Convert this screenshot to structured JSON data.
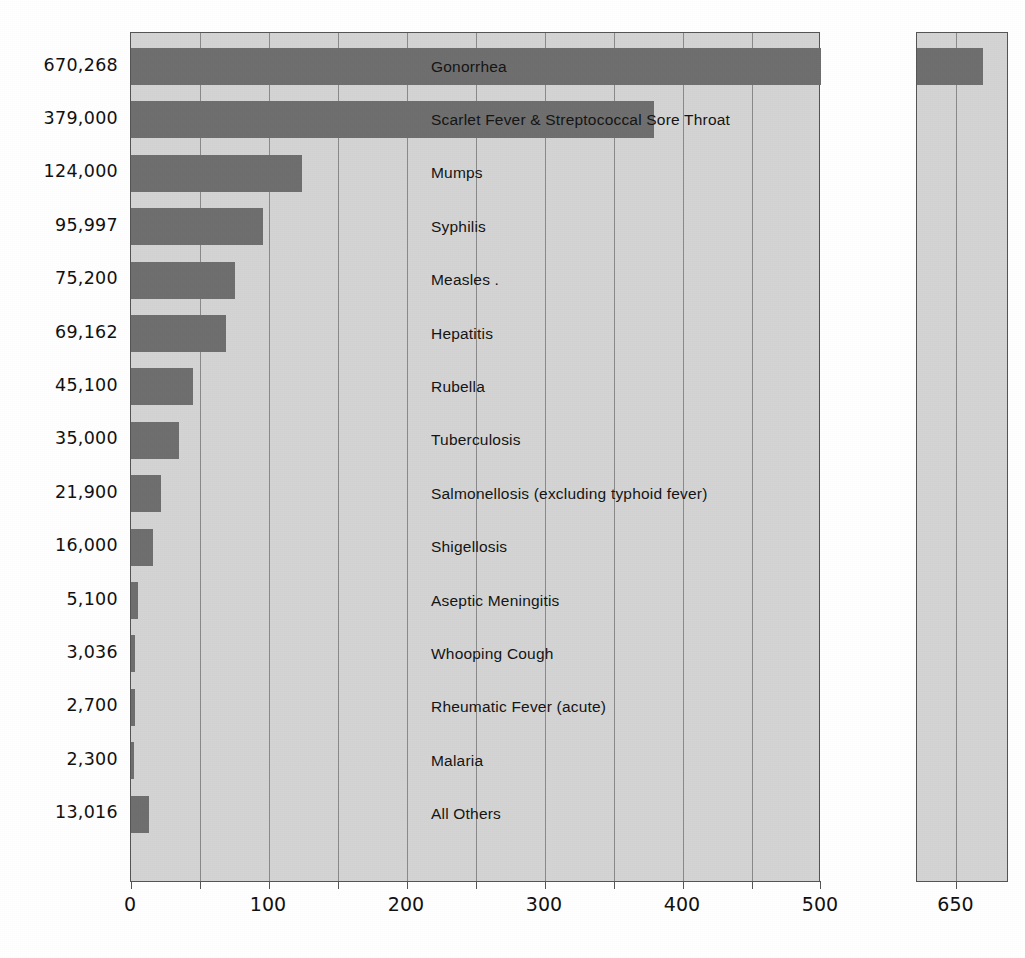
{
  "chart_data": {
    "type": "bar",
    "orientation": "horizontal",
    "title": "",
    "subtitle": "",
    "xlabel": "",
    "ylabel": "",
    "grid": true,
    "legend": null,
    "axis": {
      "xlim": [
        0,
        500
      ],
      "xticks": [
        0,
        100,
        200,
        300,
        400,
        500
      ],
      "xtick_labels": [
        "0",
        "100",
        "200",
        "300",
        "400",
        "500"
      ],
      "minor_tick_step": 50,
      "units_note": "thousands of cases",
      "break_panel": {
        "ticks": [
          650
        ],
        "tick_labels": [
          "650"
        ],
        "range": [
          620,
          690
        ]
      }
    },
    "categories": [
      "Gonorrhea",
      "Scarlet Fever & Streptococcal Sore Throat",
      "Mumps",
      "Syphilis",
      "Measles .",
      "Hepatitis",
      "Rubella",
      "Tuberculosis",
      "Salmonellosis (excluding typhoid fever)",
      "Shigellosis",
      "Aseptic Meningitis",
      "Whooping Cough",
      "Rheumatic Fever (acute)",
      "Malaria",
      "All Others"
    ],
    "value_labels": [
      "670,268",
      "379,000",
      "124,000",
      "95,997",
      "75,200",
      "69,162",
      "45,100",
      "35,000",
      "21,900",
      "16,000",
      "5,100",
      "3,036",
      "2,700",
      "2,300",
      "13,016"
    ],
    "values": [
      670.268,
      379.0,
      124.0,
      95.997,
      75.2,
      69.162,
      45.1,
      35.0,
      21.9,
      16.0,
      5.1,
      3.036,
      2.7,
      2.3,
      13.016
    ],
    "bars": [
      {
        "label": "Gonorrhea",
        "value_label": "670,268",
        "value": 670.268,
        "clipped": true
      },
      {
        "label": "Scarlet Fever & Streptococcal Sore Throat",
        "value_label": "379,000",
        "value": 379.0,
        "clipped": false
      },
      {
        "label": "Mumps",
        "value_label": "124,000",
        "value": 124.0,
        "clipped": false
      },
      {
        "label": "Syphilis",
        "value_label": "95,997",
        "value": 95.997,
        "clipped": false
      },
      {
        "label": "Measles .",
        "value_label": "75,200",
        "value": 75.2,
        "clipped": false
      },
      {
        "label": "Hepatitis",
        "value_label": "69,162",
        "value": 69.162,
        "clipped": false
      },
      {
        "label": "Rubella",
        "value_label": "45,100",
        "value": 45.1,
        "clipped": false
      },
      {
        "label": "Tuberculosis",
        "value_label": "35,000",
        "value": 35.0,
        "clipped": false
      },
      {
        "label": "Salmonellosis (excluding typhoid fever)",
        "value_label": "21,900",
        "value": 21.9,
        "clipped": false
      },
      {
        "label": "Shigellosis",
        "value_label": "16,000",
        "value": 16.0,
        "clipped": false
      },
      {
        "label": "Aseptic Meningitis",
        "value_label": "5,100",
        "value": 5.1,
        "clipped": false
      },
      {
        "label": "Whooping Cough",
        "value_label": "3,036",
        "value": 3.036,
        "clipped": false
      },
      {
        "label": "Rheumatic Fever (acute)",
        "value_label": "2,700",
        "value": 2.7,
        "clipped": false
      },
      {
        "label": "Malaria",
        "value_label": "2,300",
        "value": 2.3,
        "clipped": false
      },
      {
        "label": "All Others",
        "value_label": "13,016",
        "value": 13.016,
        "clipped": false
      }
    ],
    "colors": {
      "bar": "#6f6f6f",
      "panel_background": "#d4d4d4",
      "gridline": "#8a8a8a",
      "panel_border": "#555555",
      "text": "#111111",
      "page_background": "#ffffff"
    }
  }
}
